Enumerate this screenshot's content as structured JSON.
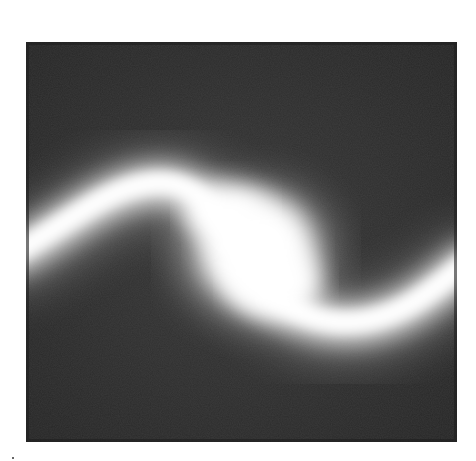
{
  "image": {
    "description": "Grayscale intensity map showing a glowing white S-shaped band on a dark square background",
    "colors": {
      "page_background": "#ffffff",
      "panel_background": "#2e2e2e",
      "glow": "#ffffff"
    },
    "panel": {
      "x": 26,
      "y": 42,
      "width": 431,
      "height": 400
    }
  }
}
